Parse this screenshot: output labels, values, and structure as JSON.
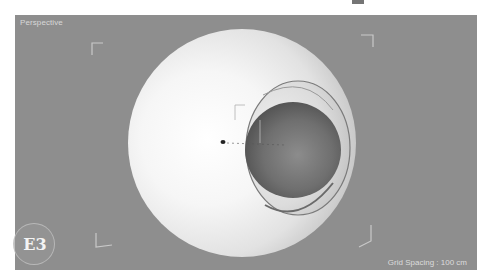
{
  "viewport": {
    "label": "Perspective",
    "grid_spacing": "Grid Spacing : 100 cm",
    "background_color": "#8e8e8e"
  },
  "badge": {
    "label": "E3"
  },
  "scene": {
    "objects": [
      {
        "name": "outer-sphere",
        "shade": "white",
        "cut": "spherical cavity on right side"
      },
      {
        "name": "inner-sphere",
        "shade": "dark gray"
      }
    ],
    "corner_brackets": [
      "top-left",
      "top-right",
      "bottom-left",
      "bottom-right"
    ]
  },
  "icons": {
    "object-axis": "axis-gizmo-icon",
    "corner-bracket": "safe-frame-corner-icon"
  }
}
